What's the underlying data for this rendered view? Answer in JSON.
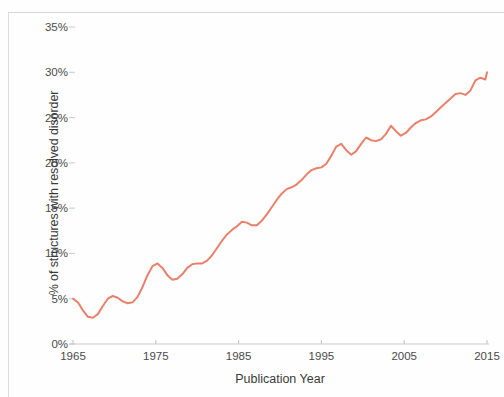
{
  "figure": {
    "background_color": "#fefefe",
    "frame_color": "#d8d8d8"
  },
  "chart_data": {
    "type": "line",
    "title": "",
    "subtitle": "",
    "xlabel": "Publication Year",
    "ylabel": "% of structures with resolved disorder",
    "xlim": [
      1965,
      2015
    ],
    "ylim": [
      0,
      35
    ],
    "xtick_labels": [
      "1965",
      "1975",
      "1985",
      "1995",
      "2005",
      "2015"
    ],
    "xticks": [
      1965,
      1975,
      1985,
      1995,
      2005,
      2015
    ],
    "ytick_labels": [
      "0%",
      "5%",
      "10%",
      "15%",
      "20%",
      "25%",
      "30%",
      "35%"
    ],
    "yticks": [
      0,
      5,
      10,
      15,
      20,
      25,
      30,
      35
    ],
    "grid": false,
    "legend": null,
    "legend_position": "none",
    "series": [
      {
        "name": "% of structures with resolved disorder",
        "color": "#e8806b",
        "line_width": 2,
        "x": [
          1965,
          1965.6,
          1966.2,
          1966.8,
          1967.4,
          1968,
          1968.6,
          1969.2,
          1969.8,
          1970.4,
          1971,
          1971.6,
          1972.2,
          1972.8,
          1973.4,
          1974,
          1974.6,
          1975.2,
          1975.8,
          1976.4,
          1977,
          1977.6,
          1978.2,
          1978.8,
          1979.4,
          1980,
          1980.6,
          1981.2,
          1981.8,
          1982.4,
          1983,
          1983.6,
          1984.2,
          1984.8,
          1985.4,
          1986,
          1986.6,
          1987.2,
          1987.8,
          1988.4,
          1989,
          1989.6,
          1990.2,
          1990.8,
          1991.4,
          1992,
          1992.6,
          1993.2,
          1993.8,
          1994.4,
          1995,
          1995.6,
          1996.2,
          1996.8,
          1997.4,
          1998,
          1998.6,
          1999.2,
          1999.8,
          2000.4,
          2001,
          2001.6,
          2002.2,
          2002.8,
          2003.4,
          2004,
          2004.6,
          2005.2,
          2005.8,
          2006.4,
          2007,
          2007.6,
          2008.2,
          2008.8,
          2009.4,
          2010,
          2010.6,
          2011.2,
          2011.8,
          2012.4,
          2013,
          2013.6,
          2014.2,
          2014.8,
          2015
        ],
        "y": [
          5.0,
          4.6,
          3.7,
          3.0,
          2.9,
          3.3,
          4.2,
          5.0,
          5.3,
          5.1,
          4.7,
          4.5,
          4.6,
          5.2,
          6.3,
          7.6,
          8.6,
          8.9,
          8.4,
          7.6,
          7.1,
          7.2,
          7.7,
          8.4,
          8.8,
          8.9,
          8.9,
          9.2,
          9.8,
          10.6,
          11.4,
          12.1,
          12.6,
          13.0,
          13.5,
          13.4,
          13.1,
          13.1,
          13.6,
          14.3,
          15.1,
          15.9,
          16.6,
          17.1,
          17.3,
          17.6,
          18.1,
          18.7,
          19.2,
          19.4,
          19.5,
          19.9,
          20.8,
          21.8,
          22.1,
          21.4,
          20.9,
          21.3,
          22.1,
          22.8,
          22.5,
          22.4,
          22.6,
          23.2,
          24.1,
          23.5,
          23.0,
          23.3,
          23.9,
          24.4,
          24.7,
          24.8,
          25.1,
          25.6,
          26.1,
          26.6,
          27.1,
          27.6,
          27.7,
          27.5,
          28.0,
          29.1,
          29.4,
          29.2,
          30.0
        ]
      }
    ],
    "annotations": []
  }
}
